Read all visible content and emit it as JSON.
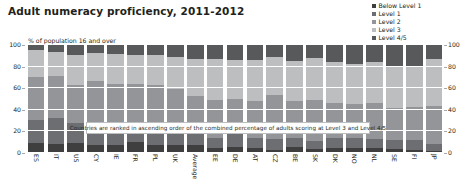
{
  "header": {
    "title": "Adult numeracy proficiency, 2011-2012"
  },
  "legend": {
    "position": "top-right",
    "items": [
      {
        "label": "Below Level 1",
        "color": "#3f3f3f"
      },
      {
        "label": "Level 1",
        "color": "#6d6e71"
      },
      {
        "label": "Level 2",
        "color": "#939598"
      },
      {
        "label": "Level 3",
        "color": "#bcbec0"
      },
      {
        "label": "Level 4/5",
        "color": "#58595b"
      }
    ]
  },
  "annotation": {
    "text": "Countries are ranked in ascending order of the combined percentage of adults scoring at Level 3 and Level 4/5"
  },
  "axes": {
    "ylabel_note": "% of population 16 and over",
    "yticks": [
      "0",
      "20",
      "40",
      "60",
      "80",
      "100"
    ],
    "yticks_right": [
      "0",
      "20",
      "40",
      "60",
      "80",
      "100"
    ]
  },
  "chart_data": {
    "type": "bar",
    "subtype": "stacked-100-percent",
    "title": "Adult numeracy proficiency, 2011-2012",
    "subtitle": "% of population 16 and over",
    "xlabel": "",
    "ylabel": "% of population 16 and over",
    "ylim": [
      0,
      100
    ],
    "yticks": [
      0,
      20,
      40,
      60,
      80,
      100
    ],
    "grid": true,
    "legend_position": "top-right",
    "annotation": "Countries are ranked in ascending order of the combined percentage of adults scoring at Level 3 and Level 4/5",
    "categories": [
      "ES",
      "IT",
      "US",
      "CY",
      "IE",
      "FR",
      "PL",
      "UK",
      "Average",
      "EE",
      "DE",
      "AT",
      "CZ",
      "BE",
      "SK",
      "DK",
      "NO",
      "NL",
      "SE",
      "FI",
      "JP"
    ],
    "series": [
      {
        "name": "Below Level 1",
        "color": "#3f3f3f",
        "values": [
          9,
          8,
          9,
          7,
          7,
          10,
          7,
          7,
          7,
          5,
          6,
          5,
          3,
          6,
          4,
          5,
          5,
          5,
          4,
          3,
          2
        ]
      },
      {
        "name": "Level 1",
        "color": "#6d6e71",
        "values": [
          22,
          24,
          19,
          21,
          19,
          18,
          17,
          17,
          13,
          9,
          12,
          9,
          10,
          8,
          7,
          9,
          9,
          8,
          8,
          9,
          6
        ]
      },
      {
        "name": "Level 2",
        "color": "#939598",
        "values": [
          39,
          39,
          35,
          39,
          38,
          36,
          39,
          35,
          33,
          35,
          32,
          34,
          41,
          34,
          38,
          32,
          31,
          33,
          30,
          31,
          36
        ]
      },
      {
        "name": "Level 3",
        "color": "#bcbec0",
        "values": [
          25,
          23,
          28,
          26,
          28,
          27,
          28,
          30,
          34,
          38,
          36,
          38,
          35,
          37,
          39,
          38,
          37,
          38,
          38,
          38,
          43
        ]
      },
      {
        "name": "Level 4/5",
        "color": "#58595b",
        "values": [
          5,
          6,
          9,
          7,
          8,
          9,
          9,
          11,
          13,
          13,
          14,
          14,
          11,
          15,
          12,
          16,
          18,
          16,
          20,
          19,
          13
        ]
      }
    ]
  }
}
